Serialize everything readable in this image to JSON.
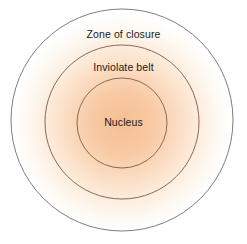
{
  "diagram": {
    "type": "concentric-circles",
    "background_color": "#ffffff",
    "canvas": {
      "width": 247,
      "height": 244
    },
    "zones": [
      {
        "id": "zone-of-closure",
        "label": "Zone of closure",
        "order": 1,
        "center": {
          "x": 122,
          "y": 120
        },
        "radius": 111,
        "stroke_color": "#7d7d7d",
        "stroke_width": 1
      },
      {
        "id": "inviolate-belt",
        "label": "Inviolate belt",
        "order": 2,
        "center": {
          "x": 122,
          "y": 122
        },
        "radius": 77,
        "stroke_color": "#8a6a52",
        "stroke_width": 1
      },
      {
        "id": "nucleus",
        "label": "Nucleus",
        "order": 3,
        "center": {
          "x": 122,
          "y": 123
        },
        "radius": 45,
        "stroke_color": "#8a6a52",
        "stroke_width": 1
      }
    ],
    "gradient": {
      "type": "radial",
      "center": {
        "x": 122,
        "y": 123
      },
      "stops": [
        {
          "offset": "0%",
          "color": "#f6bf93"
        },
        {
          "offset": "28%",
          "color": "#f8c9a4"
        },
        {
          "offset": "42%",
          "color": "#fad5b6"
        },
        {
          "offset": "58%",
          "color": "#fce3cd"
        },
        {
          "offset": "74%",
          "color": "#fdf0e3"
        },
        {
          "offset": "88%",
          "color": "#fefaf4"
        },
        {
          "offset": "100%",
          "color": "#ffffff"
        }
      ]
    },
    "label_color": "#1a1a1a"
  }
}
